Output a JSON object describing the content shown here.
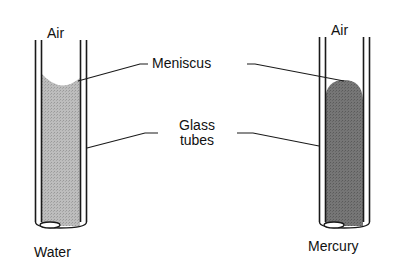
{
  "diagram": {
    "type": "capillary-meniscus-comparison",
    "labels": {
      "air_left": "Air",
      "air_right": "Air",
      "meniscus": "Meniscus",
      "glass_tubes_line1": "Glass",
      "glass_tubes_line2": "tubes",
      "water": "Water",
      "mercury": "Mercury"
    },
    "tubes": [
      {
        "name": "water-tube",
        "liquid": "Water",
        "meniscus_shape": "concave",
        "fill_color": "#b4b4b4"
      },
      {
        "name": "mercury-tube",
        "liquid": "Mercury",
        "meniscus_shape": "convex",
        "fill_color": "#6e6e6e"
      }
    ],
    "colors": {
      "stroke": "#1a1a1a",
      "background": "#ffffff",
      "water_fill": "#b4b4b4",
      "mercury_fill": "#6e6e6e"
    }
  }
}
